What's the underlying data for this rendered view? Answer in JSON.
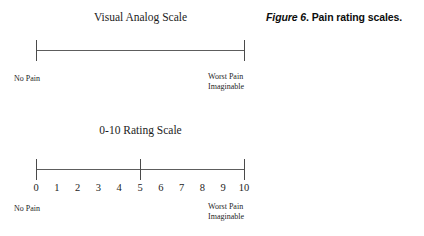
{
  "figure": {
    "caption_label": "Figure 6",
    "caption_separator": ". ",
    "caption_text": "Pain rating scales."
  },
  "scales": [
    {
      "id": "vas",
      "title": "Visual Analog Scale",
      "anchor_left": "No Pain",
      "anchor_right_line1": "Worst Pain",
      "anchor_right_line2": "Imaginable",
      "ticks": [
        "start",
        "end"
      ],
      "numbers": []
    },
    {
      "id": "nrs",
      "title": "0-10 Rating Scale",
      "anchor_left": "No Pain",
      "anchor_right_line1": "Worst Pain",
      "anchor_right_line2": "Imaginable",
      "ticks": [
        "start",
        "mid",
        "end"
      ],
      "numbers": [
        "0",
        "1",
        "2",
        "3",
        "4",
        "5",
        "6",
        "7",
        "8",
        "9",
        "10"
      ]
    }
  ],
  "colors": {
    "background": "#ffffff",
    "ink": "#1a1a1a",
    "rule": "#5d5d5d",
    "tick": "#4a4a4a"
  }
}
